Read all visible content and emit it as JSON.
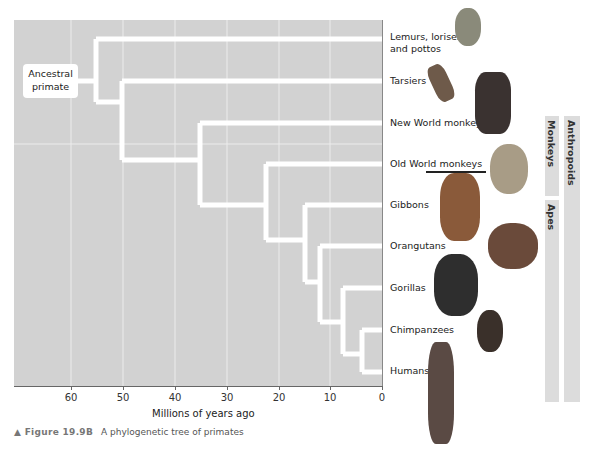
{
  "figure": {
    "caption_prefix": "▲ Figure 19.9B",
    "caption_text": "A phylogenetic tree of primates"
  },
  "root_label_line1": "Ancestral",
  "root_label_line2": "primate",
  "axis": {
    "label": "Millions of years ago",
    "ticks": [
      "60",
      "50",
      "40",
      "30",
      "20",
      "10",
      "0"
    ]
  },
  "taxa": [
    {
      "line1": "Lemurs, lorises,",
      "line2": "and pottos"
    },
    {
      "line1": "Tarsiers"
    },
    {
      "line1": "New World monkeys"
    },
    {
      "line1": "Old World monkeys"
    },
    {
      "line1": "Gibbons"
    },
    {
      "line1": "Orangutans"
    },
    {
      "line1": "Gorillas"
    },
    {
      "line1": "Chimpanzees"
    },
    {
      "line1": "Humans"
    }
  ],
  "groups": {
    "monkeys": "Monkeys",
    "apes": "Apes",
    "anthropoids": "Anthropoids"
  },
  "colors": {
    "plot_bg": "#d2d2d2",
    "branch": "#ffffff",
    "group_bar": "#dcdcdc"
  }
}
